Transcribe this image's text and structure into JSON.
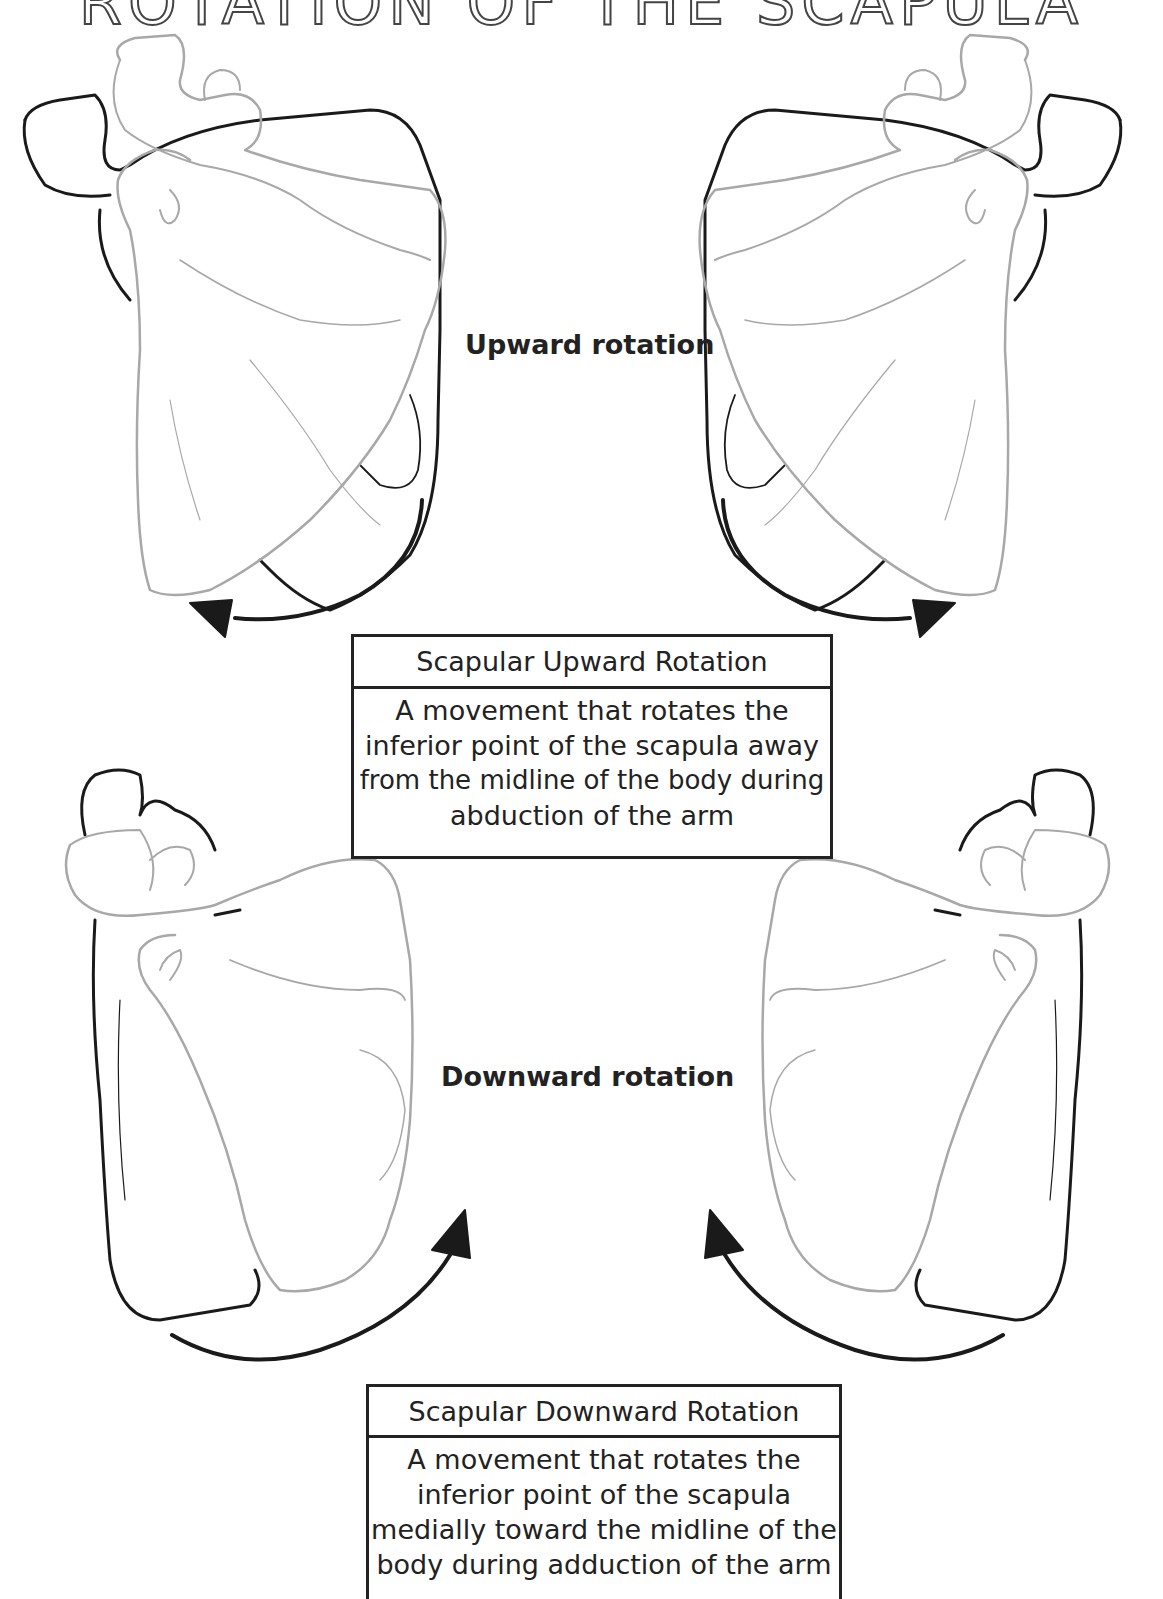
{
  "title": "ROTATION OF THE SCAPULA",
  "sections": [
    {
      "label": "Upward rotation",
      "definition": {
        "heading": "Scapular Upward Rotation",
        "lines": [
          "A movement that rotates the",
          "inferior point of the scapula away",
          "from the midline of the body during",
          "abduction of the arm"
        ]
      },
      "illustrations": [
        "left-scapula-upward",
        "right-scapula-upward"
      ]
    },
    {
      "label": "Downward rotation",
      "definition": {
        "heading": "Scapular Downward Rotation",
        "lines": [
          "A movement that rotates the",
          "inferior point of the scapula",
          "medially toward the midline of the",
          "body during adduction of the arm"
        ]
      },
      "illustrations": [
        "left-scapula-downward",
        "right-scapula-downward"
      ]
    }
  ],
  "colors": {
    "outline_dark": "#1a1a1a",
    "outline_light": "#a8a8a8",
    "text": "#222222",
    "background": "#ffffff"
  }
}
